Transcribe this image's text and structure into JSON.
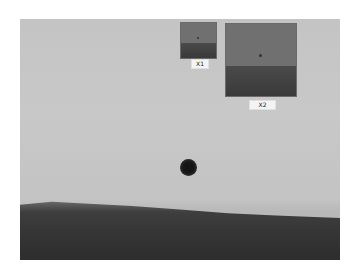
{
  "image": {
    "description": "Grayscale sky photo with a small dark object and a dark horizon band",
    "insets": [
      {
        "label": "X1"
      },
      {
        "label": "X2"
      }
    ]
  },
  "colors": {
    "sky": "#c6c6c6",
    "ground": "#343434",
    "inset_sky": "#707070",
    "object": "#151515"
  }
}
